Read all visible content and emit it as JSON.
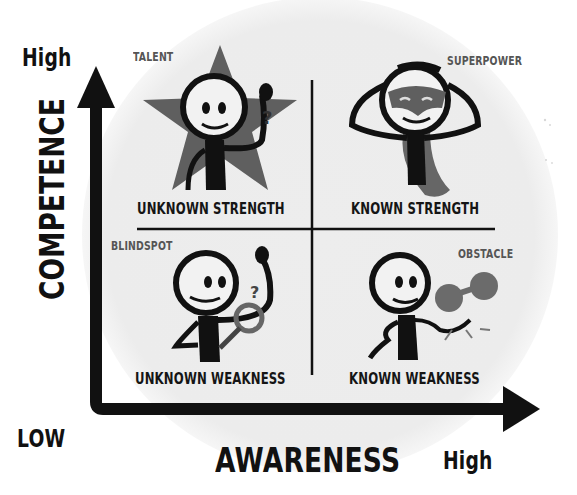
{
  "diagram": {
    "y_axis": {
      "label": "COMPETENCE",
      "high_label": "High"
    },
    "x_axis": {
      "label": "AWARENESS",
      "low_label": "LOW",
      "high_label": "High"
    },
    "quadrants": [
      {
        "position": "top-left",
        "tag": "TALENT",
        "title": "UNKNOWN STRENGTH",
        "illustration": "star-figure-scratching-head"
      },
      {
        "position": "top-right",
        "tag": "SUPERPOWER",
        "title": "KNOWN STRENGTH",
        "illustration": "masked-hero-figure-with-cape"
      },
      {
        "position": "bottom-left",
        "tag": "BLINDSPOT",
        "title": "UNKNOWN WEAKNESS",
        "illustration": "figure-with-magnifying-glass"
      },
      {
        "position": "bottom-right",
        "tag": "OBSTACLE",
        "title": "KNOWN WEAKNESS",
        "illustration": "figure-dragging-ball-and-chain"
      }
    ],
    "colors": {
      "ink": "#111111",
      "accent_gray": "#6b6b6b",
      "backdrop": "#ececec"
    }
  }
}
